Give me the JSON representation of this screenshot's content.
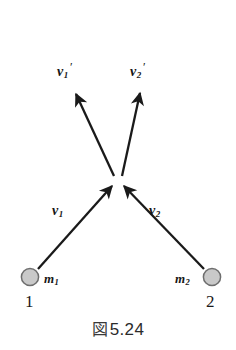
{
  "figure": {
    "caption_symbol": "図",
    "caption_number": "5.24",
    "background_color": "#ffffff",
    "stroke_color": "#1a1a1a"
  },
  "bodies": [
    {
      "name": "body-1",
      "mass_label": "m",
      "mass_subscript": "1",
      "index_label": "1",
      "fill_color": "#c9c9c9",
      "stroke_color": "#6e6e6e",
      "cx": 30,
      "cy": 277,
      "r": 9
    },
    {
      "name": "body-2",
      "mass_label": "m",
      "mass_subscript": "2",
      "index_label": "2",
      "fill_color": "#c9c9c9",
      "stroke_color": "#6e6e6e",
      "cx": 212,
      "cy": 277,
      "r": 9
    }
  ],
  "vectors": [
    {
      "name": "incoming-velocity-1",
      "symbol": "v",
      "subscript": "1",
      "prime": "",
      "x1": 38,
      "y1": 269,
      "x2": 112,
      "y2": 186,
      "label_x": 52,
      "label_y": 205
    },
    {
      "name": "incoming-velocity-2",
      "symbol": "v",
      "subscript": "2",
      "prime": "",
      "x1": 204,
      "y1": 269,
      "x2": 124,
      "y2": 186,
      "label_x": 149,
      "label_y": 205
    },
    {
      "name": "outgoing-velocity-1",
      "symbol": "v",
      "subscript": "1",
      "prime": "′",
      "x1": 114,
      "y1": 176,
      "x2": 75,
      "y2": 93,
      "label_x": 57,
      "label_y": 68
    },
    {
      "name": "outgoing-velocity-2",
      "symbol": "v",
      "subscript": "2",
      "prime": "′",
      "x1": 122,
      "y1": 176,
      "x2": 141,
      "y2": 92,
      "label_x": 130,
      "label_y": 68
    }
  ],
  "collision_point": {
    "name": "collision-vertex",
    "x": 118,
    "y": 181
  }
}
